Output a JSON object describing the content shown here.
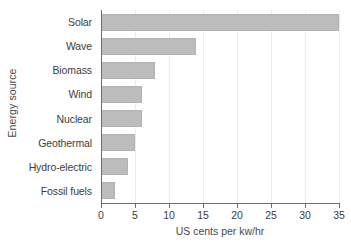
{
  "chart_data": {
    "type": "bar",
    "orientation": "horizontal",
    "title": "",
    "xlabel": "US cents per kw/hr",
    "ylabel": "Energy source",
    "categories": [
      "Solar",
      "Wave",
      "Biomass",
      "Wind",
      "Nuclear",
      "Geothermal",
      "Hydro-electric",
      "Fossil fuels"
    ],
    "values": [
      35,
      14,
      8,
      6,
      6,
      5,
      4,
      2
    ],
    "xlim": [
      0,
      35
    ],
    "xticks": [
      0,
      5,
      10,
      15,
      20,
      25,
      30,
      35
    ],
    "xtick_labels": [
      "0",
      "5",
      "10",
      "15",
      "20",
      "25",
      "30",
      "35"
    ],
    "grid": true,
    "grid_axis": "x",
    "legend": false,
    "bar_color": "#bcbcbc",
    "bar_edge_color": "#b2b2b2",
    "axis_color": "#6e6e6e",
    "grid_color": "#ececec",
    "text_color": "#3d3d3d",
    "background": "#ffffff"
  }
}
